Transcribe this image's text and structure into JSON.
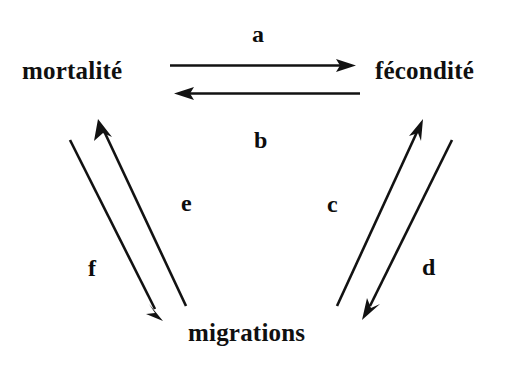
{
  "diagram": {
    "background_color": "#ffffff",
    "ink_color": "#121212",
    "nodes": [
      {
        "id": "mortalite",
        "label": "mortalité",
        "x": 22,
        "y": 58
      },
      {
        "id": "fecondite",
        "label": "fécondité",
        "x": 375,
        "y": 58
      },
      {
        "id": "migrations",
        "label": "migrations",
        "x": 188,
        "y": 320
      }
    ],
    "edges": [
      {
        "id": "a",
        "label": "a",
        "from": "mortalite",
        "to": "fecondite",
        "direction": "right",
        "label_x": 252,
        "label_y": 22
      },
      {
        "id": "b",
        "label": "b",
        "from": "fecondite",
        "to": "mortalite",
        "direction": "left",
        "label_x": 254,
        "label_y": 128
      },
      {
        "id": "c",
        "label": "c",
        "from": "migrations",
        "to": "fecondite",
        "direction": "up-right",
        "label_x": 327,
        "label_y": 192
      },
      {
        "id": "d",
        "label": "d",
        "from": "fecondite",
        "to": "migrations",
        "direction": "down-left",
        "label_x": 422,
        "label_y": 255
      },
      {
        "id": "e",
        "label": "e",
        "from": "migrations",
        "to": "mortalite",
        "direction": "up-left",
        "label_x": 181,
        "label_y": 191
      },
      {
        "id": "f",
        "label": "f",
        "from": "mortalite",
        "to": "migrations",
        "direction": "down-right",
        "label_x": 88,
        "label_y": 256
      }
    ]
  }
}
